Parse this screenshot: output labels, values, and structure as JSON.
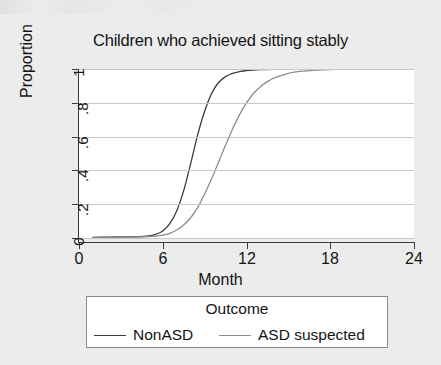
{
  "figure": {
    "background_color": "#ececec",
    "panel_color": "#ffffff",
    "axis_color": "#3a3a3a",
    "grid_color": "#c8c8c8"
  },
  "chart_data": {
    "type": "line",
    "title": "Children who achieved sitting stably",
    "xlabel": "Month",
    "ylabel": "Proportion",
    "xlim": [
      0,
      24
    ],
    "ylim": [
      0,
      1
    ],
    "xticks": [
      0,
      6,
      12,
      18,
      24
    ],
    "xtick_labels": [
      "0",
      "6",
      "12",
      "18",
      "24"
    ],
    "yticks": [
      0,
      0.2,
      0.4,
      0.6,
      0.8,
      1
    ],
    "ytick_labels": [
      "0",
      ".2",
      ".4",
      ".6",
      ".8",
      "1"
    ],
    "grid": "horizontal",
    "legend_position": "below-plot",
    "legend_title": "Outcome",
    "series": [
      {
        "name": "NonASD",
        "color": "#3c3c3c",
        "width": 1.3,
        "x": [
          1,
          2,
          3,
          4,
          5,
          5.5,
          6,
          6.5,
          7,
          7.5,
          8,
          8.5,
          9,
          9.5,
          10,
          10.5,
          11,
          11.5,
          12,
          13,
          14,
          15,
          16,
          17,
          18,
          19,
          20
        ],
        "y": [
          0.004,
          0.005,
          0.006,
          0.008,
          0.013,
          0.022,
          0.042,
          0.085,
          0.16,
          0.28,
          0.44,
          0.61,
          0.75,
          0.855,
          0.92,
          0.955,
          0.974,
          0.985,
          0.991,
          0.996,
          0.998,
          0.999,
          1.0,
          1.0,
          1.0,
          1.0,
          1.0
        ]
      },
      {
        "name": "ASD suspected",
        "color": "#8c8c8c",
        "width": 1.3,
        "x": [
          1,
          2,
          3,
          4,
          5,
          5.5,
          6,
          6.5,
          7,
          7.5,
          8,
          8.5,
          9,
          9.5,
          10,
          10.5,
          11,
          11.5,
          12,
          12.5,
          13,
          13.5,
          14,
          15,
          16,
          17,
          18,
          19,
          20
        ],
        "y": [
          0.004,
          0.004,
          0.005,
          0.006,
          0.008,
          0.011,
          0.017,
          0.028,
          0.047,
          0.077,
          0.12,
          0.18,
          0.26,
          0.35,
          0.45,
          0.55,
          0.645,
          0.73,
          0.8,
          0.855,
          0.895,
          0.925,
          0.947,
          0.974,
          0.987,
          0.993,
          0.997,
          0.999,
          1.0
        ]
      }
    ],
    "annotations": []
  },
  "legend": {
    "title": "Outcome",
    "entries": [
      {
        "label": "NonASD",
        "color": "#3c3c3c"
      },
      {
        "label": "ASD suspected",
        "color": "#8c8c8c"
      }
    ]
  }
}
